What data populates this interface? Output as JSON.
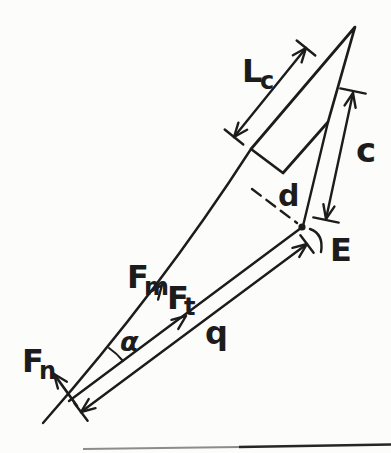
{
  "figure": {
    "background_color": "#fcfcfa",
    "ink_color": "#1c1c1c",
    "labels": {
      "muscle_force": {
        "base": "F",
        "sub": "m"
      },
      "tangential_force": {
        "base": "F",
        "sub": "t"
      },
      "normal_force": {
        "base": "F",
        "sub": "n"
      },
      "length_lc": {
        "base": "L",
        "sub": "c"
      },
      "distance_c": "c",
      "moment_arm_d": "d",
      "distance_q": "q",
      "joint_label": "E",
      "angle_alpha": "α"
    },
    "symbols": {
      "joint_point": "filled-dot",
      "dimension_ends": "arrowhead-with-tick",
      "moment_arm_style": "dashed-line"
    }
  }
}
